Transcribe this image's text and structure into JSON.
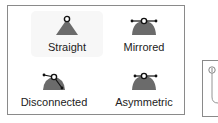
{
  "handle_types": {
    "selected": "Straight",
    "options": [
      {
        "label": "Straight",
        "icon": "straight-handle-icon",
        "selected": true
      },
      {
        "label": "Mirrored",
        "icon": "mirrored-handle-icon",
        "selected": false
      },
      {
        "label": "Disconnected",
        "icon": "disconnected-handle-icon",
        "selected": false
      },
      {
        "label": "Asymmetric",
        "icon": "asymmetric-handle-icon",
        "selected": false
      }
    ]
  },
  "colors": {
    "icon_fill": "#6b6b6b",
    "border": "#8a8a8a",
    "selected_bg": "#f7f7f7"
  }
}
